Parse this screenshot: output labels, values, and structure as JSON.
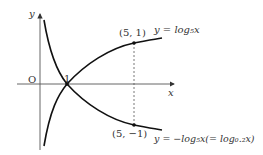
{
  "axes": {
    "x_label": "x",
    "y_label": "y",
    "origin_label": "O",
    "intercept_label": "1"
  },
  "curves": [
    {
      "name": "log5",
      "label": "y = log₅x"
    },
    {
      "name": "neglog5",
      "label": "y = −log₅x(= log₀.₂x)"
    }
  ],
  "points": [
    {
      "label": "(5, 1)"
    },
    {
      "label": "(5, −1)"
    }
  ]
}
